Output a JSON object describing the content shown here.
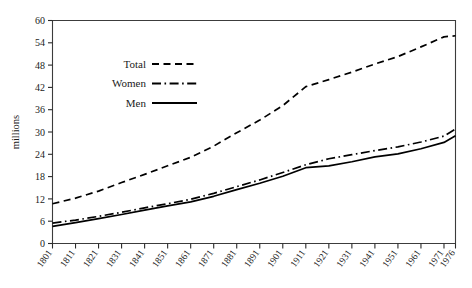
{
  "chart_data": {
    "type": "line",
    "title": "",
    "subtitle": "",
    "xlabel": "",
    "ylabel": "millions",
    "xlim": [
      1801,
      1976
    ],
    "ylim": [
      0,
      60
    ],
    "grid": false,
    "legend_position": "upper-left-inside",
    "x": [
      1801,
      1811,
      1821,
      1831,
      1841,
      1851,
      1861,
      1871,
      1881,
      1891,
      1901,
      1911,
      1921,
      1931,
      1941,
      1951,
      1961,
      1971,
      1976
    ],
    "categories": [
      "1801",
      "1811",
      "1821",
      "1831",
      "1841",
      "1851",
      "1861",
      "1871",
      "1881",
      "1891",
      "1901",
      "1911",
      "1921",
      "1931",
      "1941",
      "1951",
      "1961",
      "1971",
      "1976"
    ],
    "series": [
      {
        "name": "Total",
        "style": "dashed",
        "values": [
          10.7,
          12.2,
          14.1,
          16.4,
          18.6,
          20.9,
          23.2,
          26.2,
          29.8,
          33.2,
          37.1,
          42.2,
          44.1,
          46.1,
          48.3,
          50.3,
          52.9,
          55.6,
          55.9
        ]
      },
      {
        "name": "Women",
        "style": "dash-dot",
        "values": [
          5.5,
          6.3,
          7.3,
          8.4,
          9.6,
          10.7,
          11.9,
          13.5,
          15.3,
          17.1,
          19.1,
          21.2,
          22.8,
          23.9,
          25.0,
          26.0,
          27.3,
          28.9,
          30.8
        ]
      },
      {
        "name": "Men",
        "style": "solid",
        "values": [
          4.6,
          5.6,
          6.7,
          7.8,
          9.0,
          10.1,
          11.2,
          12.7,
          14.5,
          16.2,
          18.1,
          20.4,
          20.9,
          22.0,
          23.3,
          24.1,
          25.5,
          27.2,
          29.0
        ]
      }
    ],
    "y_ticks": [
      0,
      6,
      12,
      18,
      24,
      30,
      36,
      42,
      48,
      54,
      60
    ],
    "y_tick_labels": [
      "0",
      "6",
      "12",
      "18",
      "24",
      "30",
      "36",
      "42",
      "48",
      "54",
      "60"
    ]
  },
  "legend": {
    "items": [
      {
        "label": "Total",
        "style": "dashed"
      },
      {
        "label": "Women",
        "style": "dash-dot"
      },
      {
        "label": "Men",
        "style": "solid"
      }
    ]
  },
  "axes": {
    "y_title": "millions"
  }
}
